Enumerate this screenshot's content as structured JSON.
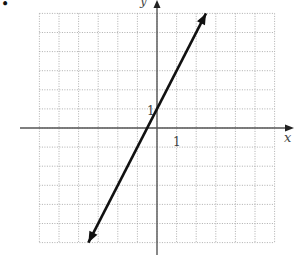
{
  "bullet": "•",
  "chart_data": {
    "type": "line",
    "title": "",
    "xlabel": "x",
    "ylabel": "y",
    "xlim": [
      -6,
      6
    ],
    "ylim": [
      -6,
      6
    ],
    "grid": true,
    "grid_style": "dotted",
    "tick_labels": {
      "x": [
        "1"
      ],
      "y": [
        "1"
      ]
    },
    "series": [
      {
        "name": "y = 2x + 1",
        "slope": 2,
        "intercept": 1,
        "points": [
          [
            -3.5,
            -6
          ],
          [
            -0.5,
            0
          ],
          [
            0,
            1
          ],
          [
            2.5,
            6
          ]
        ],
        "arrows": "both"
      }
    ]
  },
  "labels": {
    "x_axis": "x",
    "y_axis": "y",
    "x_tick": "1",
    "y_tick": "1"
  }
}
